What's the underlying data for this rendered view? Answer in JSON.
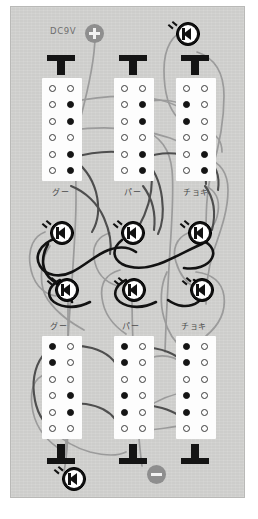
{
  "diagram": {
    "title": "DC9V",
    "kind": "breadboard-wiring-diagram",
    "panel_color": "#cdcdcb",
    "strip_color": "#fdfdfd"
  },
  "power": {
    "positive_label": "DC9V",
    "positive_icon": "plus-terminal-icon",
    "negative_icon": "minus-terminal-icon"
  },
  "top_section": {
    "switch_icon": "switch-t-icon",
    "columns": [
      {
        "label": "グー",
        "switch": "T"
      },
      {
        "label": "パー",
        "switch": "T"
      },
      {
        "label": "チョキ",
        "switch": "T"
      }
    ]
  },
  "bottom_section": {
    "switch_icon": "switch-inverted-t-icon",
    "columns": [
      {
        "label": "グー",
        "switch": "T"
      },
      {
        "label": "パー",
        "switch": "T"
      },
      {
        "label": "チョキ",
        "switch": "T"
      }
    ]
  },
  "leds": {
    "icon": "led-diode-icon",
    "row1_count": 3,
    "row2_count": 3,
    "bottom_count": 1,
    "top_count": 1,
    "total": 8
  },
  "breadboard": {
    "rows_per_strip": 6,
    "cols_per_strip": 2,
    "top_strips": [
      {
        "holes": [
          "o",
          "o",
          "o",
          "x",
          "o",
          "x",
          "o",
          "o",
          "o",
          "x",
          "o",
          "x"
        ]
      },
      {
        "holes": [
          "o",
          "o",
          "o",
          "x",
          "o",
          "x",
          "o",
          "o",
          "o",
          "x",
          "o",
          "x"
        ]
      },
      {
        "holes": [
          "o",
          "o",
          "x",
          "o",
          "x",
          "o",
          "o",
          "o",
          "o",
          "x",
          "o",
          "x"
        ]
      }
    ],
    "bottom_strips": [
      {
        "holes": [
          "x",
          "o",
          "x",
          "o",
          "o",
          "o",
          "o",
          "x",
          "x",
          "o",
          "o",
          "o"
        ]
      },
      {
        "holes": [
          "x",
          "o",
          "x",
          "o",
          "o",
          "o",
          "x",
          "o",
          "x",
          "o",
          "o",
          "o"
        ]
      },
      {
        "holes": [
          "x",
          "o",
          "x",
          "o",
          "o",
          "o",
          "x",
          "o",
          "x",
          "o",
          "o",
          "o"
        ]
      }
    ]
  }
}
